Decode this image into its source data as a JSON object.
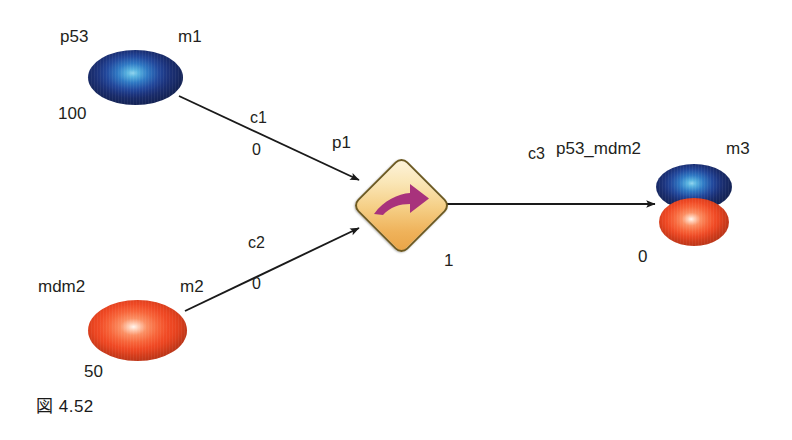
{
  "figure": {
    "caption": "図 4.52",
    "background_color": "#ffffff"
  },
  "colors": {
    "species_blue": "#22489c",
    "species_red": "#f04a25",
    "reaction_fill": "#efb25a",
    "reaction_border": "#6d5a22",
    "reaction_arrow": "#a8327c",
    "edge": "#1a1a1a",
    "text": "#231f20"
  },
  "nodes": {
    "p53": {
      "name": "p53",
      "id_label": "m1",
      "quantity": "100",
      "shape": "ellipse",
      "color": "#22489c"
    },
    "mdm2": {
      "name": "mdm2",
      "id_label": "m2",
      "quantity": "50",
      "shape": "ellipse",
      "color": "#f04a25"
    },
    "complex": {
      "name": "p53_mdm2",
      "id_label": "m3",
      "quantity": "0",
      "shape": "stacked-ellipse",
      "color_top": "#22489c",
      "color_bottom": "#f04a25"
    },
    "reaction": {
      "id_label": "p1",
      "quantity": "1",
      "shape": "diamond",
      "glyph": "reaction-arrow-icon"
    }
  },
  "edges": {
    "c1": {
      "label": "c1",
      "value": "0",
      "from": "p53",
      "to": "p1"
    },
    "c2": {
      "label": "c2",
      "value": "0",
      "from": "mdm2",
      "to": "p1"
    },
    "c3": {
      "label": "c3",
      "value": "",
      "from": "p1",
      "to": "p53_mdm2"
    }
  }
}
